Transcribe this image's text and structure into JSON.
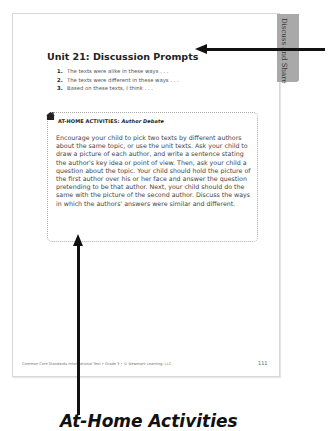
{
  "page": {
    "side_tab": "Discuss and Share",
    "title": "Unit 21: Discussion Prompts",
    "prompts": [
      {
        "num": "1.",
        "text": "The texts were alike in these ways . . ."
      },
      {
        "num": "2.",
        "text": "The texts were different in these ways . . ."
      },
      {
        "num": "3.",
        "text": "Based on these texts, I think . . ."
      }
    ],
    "activity_box": {
      "icon": "house-icon",
      "label": "AT-HOME ACTIVITIES:",
      "activity_name": "Author Debate",
      "body": "Encourage your child to pick two texts by different authors about the same topic, or use the unit texts. Ask your child to draw a picture of each author, and write a sentence stating the author's key idea or point of view. Then, ask your child a question about the topic. Your child should hold the picture of the first author over his or her face and answer the question pretending to be that author. Next, your child should do the same with the picture of the second author. Discuss the ways in which the authors' answers were similar and different."
    },
    "footer": "Common Core Standards Informational Text • Grade 3 • © Newmark Learning, LLC",
    "page_number": "111"
  },
  "annotation": {
    "caption": "At-Home Activities"
  }
}
